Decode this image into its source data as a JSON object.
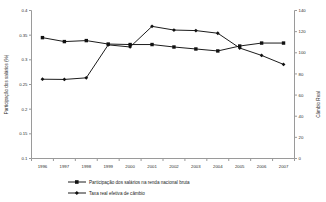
{
  "chart_data": {
    "type": "line",
    "title": "",
    "xlabel": "",
    "ylabel": "Participação dos salários (%)",
    "y2label": "Câmbio Real",
    "grid": false,
    "legend_position": "bottom",
    "categories": [
      "1996",
      "1997",
      "1998",
      "1999",
      "2000",
      "2001",
      "2002",
      "2003",
      "2004",
      "2005",
      "2006",
      "2007"
    ],
    "ylim": [
      0.1,
      0.4
    ],
    "yticks": [
      "0.1",
      "0.15",
      "0.2",
      "0.25",
      "0.3",
      "0.35",
      "0.4"
    ],
    "ytick_values": [
      0.1,
      0.15,
      0.2,
      0.25,
      0.3,
      0.35,
      0.4
    ],
    "y2lim": [
      0,
      140
    ],
    "y2ticks": [
      "0",
      "20",
      "40",
      "60",
      "80",
      "100",
      "120",
      "140"
    ],
    "y2tick_values": [
      0,
      20,
      40,
      60,
      80,
      100,
      120,
      140
    ],
    "series": [
      {
        "name": "Participação dos salários na renda nacional bruta",
        "axis": "left",
        "marker": "square",
        "values": [
          0.345,
          0.337,
          0.339,
          0.332,
          0.331,
          0.331,
          0.326,
          0.322,
          0.318,
          0.328,
          0.334,
          0.334
        ]
      },
      {
        "name": "Taxa real efetiva de câmbio",
        "axis": "right",
        "marker": "diamond",
        "values": [
          75.0,
          74.8,
          76.3,
          107.5,
          105.5,
          125.0,
          121.5,
          121.0,
          118.5,
          104.5,
          97.5,
          89.0
        ]
      }
    ]
  },
  "axes": {
    "left_title": "Participação dos salários (%)",
    "right_title": "Câmbio Real"
  },
  "legend": {
    "items": [
      {
        "label": "Participação dos salários na renda nacional bruta",
        "marker": "square"
      },
      {
        "label": "Taxa real efetiva de câmbio",
        "marker": "diamond"
      }
    ]
  }
}
